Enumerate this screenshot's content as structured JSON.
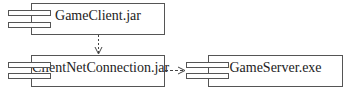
{
  "diagram": {
    "type": "UML component diagram",
    "components": [
      {
        "id": "gameclient",
        "label": "GameClient.jar"
      },
      {
        "id": "clientnet",
        "label": "ClientNetConnection.jar"
      },
      {
        "id": "gameserver",
        "label": "GameServer.exe"
      }
    ],
    "dependencies": [
      {
        "from": "GameClient.jar",
        "to": "ClientNetConnection.jar",
        "style": "dashed"
      },
      {
        "from": "ClientNetConnection.jar",
        "to": "GameServer.exe",
        "style": "dashed"
      }
    ],
    "colors": {
      "line": "#555555",
      "text": "#222222",
      "background": "#ffffff"
    }
  }
}
